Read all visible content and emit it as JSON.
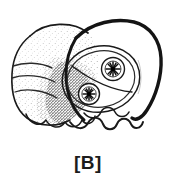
{
  "figure": {
    "caption": "[B]",
    "background_color": "#ffffff",
    "ink_color": "#1a1a1a",
    "stipple_color": "#4a4a4a",
    "panel_label": "B",
    "illustration": {
      "name": "stippled-embryo-head-line-drawing",
      "description": "Black ink line drawing with stippled shading: a lobed stippled mass at the left adjoining a smooth outlined head-like form at the right containing an oval with two inner circles each bearing a radiating starburst center, and a wavy scalloped line along the lower right border.",
      "parts": [
        {
          "name": "outer-head-outline",
          "stroke_width": 3.2,
          "filled": false
        },
        {
          "name": "lobed-stippled-mass",
          "lobe_count": 4,
          "shading": "stipple"
        },
        {
          "name": "central-oval",
          "stroke_width": 1.4,
          "contents": "two-circles-with-starburst"
        },
        {
          "name": "oval-divider-line",
          "stroke_width": 1.4
        },
        {
          "name": "upper-starburst-circle",
          "radius": 11,
          "center": [
            113,
            69
          ]
        },
        {
          "name": "lower-starburst-circle",
          "radius": 10,
          "center": [
            89,
            94
          ]
        },
        {
          "name": "wavy-lower-border",
          "wave_count": 5
        },
        {
          "name": "lower-lobe-cluster",
          "bump_count": 4
        }
      ]
    }
  }
}
